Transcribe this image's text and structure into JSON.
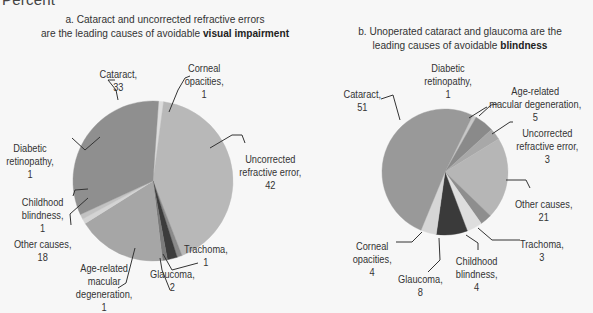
{
  "header": {
    "percent_label": "Percent"
  },
  "chart_data": [
    {
      "type": "pie",
      "id": "a",
      "title_prefix": "a. Cataract and uncorrected refractive errors",
      "title_line2": "are the leading causes of avoidable ",
      "title_bold": "visual impairment",
      "center": [
        153,
        181
      ],
      "radius": 80,
      "start_angle_deg": 4,
      "slices": [
        {
          "name": "Corneal opacities",
          "value": 1,
          "color": "#dcdcdc",
          "label_lines": [
            "Corneal",
            "opacities,",
            "1"
          ]
        },
        {
          "name": "Uncorrected refractive error",
          "value": 42,
          "color": "#b8b8b8",
          "label_lines": [
            "Uncorrected",
            "refractive error,",
            "42"
          ]
        },
        {
          "name": "Trachoma",
          "value": 1,
          "color": "#8a8a8a",
          "label_lines": [
            "Trachoma,",
            "1"
          ]
        },
        {
          "name": "Glaucoma",
          "value": 2,
          "color": "#3c3c3c",
          "label_lines": [
            "Glaucoma,",
            "2"
          ]
        },
        {
          "name": "Age-related macular degeneration",
          "value": 1,
          "color": "#7a7a7a",
          "label_lines": [
            "Age-related",
            "macular",
            "degeneration,",
            "1"
          ]
        },
        {
          "name": "Other causes",
          "value": 18,
          "color": "#a6a6a6",
          "label_lines": [
            "Other causes,",
            "18"
          ]
        },
        {
          "name": "Childhood blindness",
          "value": 1,
          "color": "#d4d4d4",
          "label_lines": [
            "Childhood",
            "blindness,",
            "1"
          ]
        },
        {
          "name": "Diabetic retinopathy",
          "value": 1,
          "color": "#c2c2c2",
          "label_lines": [
            "Diabetic",
            "retinopathy,",
            "1"
          ]
        },
        {
          "name": "Cataract",
          "value": 33,
          "color": "#8f8f8f",
          "label_lines": [
            "Cataract,",
            "33"
          ]
        }
      ]
    },
    {
      "type": "pie",
      "id": "b",
      "title_prefix": "b. Unoperated cataract and glaucoma are the",
      "title_line2": "leading causes of avoidable ",
      "title_bold": "blindness",
      "center": [
        445,
        172
      ],
      "radius": 63,
      "start_angle_deg": 26,
      "slices": [
        {
          "name": "Diabetic retinopathy",
          "value": 1,
          "color": "#c8c8c8",
          "label_lines": [
            "Diabetic",
            "retinopathy,",
            "1"
          ]
        },
        {
          "name": "Age-related macular degeneration",
          "value": 5,
          "color": "#8a8a8a",
          "label_lines": [
            "Age-related",
            "macular degeneration,",
            "5"
          ]
        },
        {
          "name": "Uncorrected refractive error",
          "value": 3,
          "color": "#a8a8a8",
          "label_lines": [
            "Uncorrected",
            "refractive error,",
            "3"
          ]
        },
        {
          "name": "Other causes",
          "value": 21,
          "color": "#b6b6b6",
          "label_lines": [
            "Other causes,",
            "21"
          ]
        },
        {
          "name": "Trachoma",
          "value": 3,
          "color": "#8e8e8e",
          "label_lines": [
            "Trachoma,",
            "3"
          ]
        },
        {
          "name": "Childhood blindness",
          "value": 4,
          "color": "#dedede",
          "label_lines": [
            "Childhood",
            "blindness,",
            "4"
          ]
        },
        {
          "name": "Glaucoma",
          "value": 8,
          "color": "#3a3a3a",
          "label_lines": [
            "Glaucoma,",
            "8"
          ]
        },
        {
          "name": "Corneal opacities",
          "value": 4,
          "color": "#d6d6d6",
          "label_lines": [
            "Corneal",
            "opacities,",
            "4"
          ]
        },
        {
          "name": "Cataract",
          "value": 51,
          "color": "#999999",
          "label_lines": [
            "Cataract,",
            "51"
          ]
        }
      ]
    }
  ],
  "labels": [
    {
      "chart": 0,
      "slice": 8,
      "x": 118,
      "y": 68
    },
    {
      "chart": 0,
      "slice": 0,
      "x": 204,
      "y": 62
    },
    {
      "chart": 0,
      "slice": 1,
      "x": 270,
      "y": 153
    },
    {
      "chart": 0,
      "slice": 7,
      "x": 30,
      "y": 142
    },
    {
      "chart": 0,
      "slice": 6,
      "x": 42,
      "y": 196
    },
    {
      "chart": 0,
      "slice": 5,
      "x": 42,
      "y": 238
    },
    {
      "chart": 0,
      "slice": 4,
      "x": 104,
      "y": 262
    },
    {
      "chart": 0,
      "slice": 3,
      "x": 172,
      "y": 268
    },
    {
      "chart": 0,
      "slice": 2,
      "x": 206,
      "y": 243
    },
    {
      "chart": 1,
      "slice": 8,
      "x": 362,
      "y": 88
    },
    {
      "chart": 1,
      "slice": 0,
      "x": 448,
      "y": 62
    },
    {
      "chart": 1,
      "slice": 1,
      "x": 535,
      "y": 85
    },
    {
      "chart": 1,
      "slice": 2,
      "x": 547,
      "y": 127
    },
    {
      "chart": 1,
      "slice": 3,
      "x": 543,
      "y": 198
    },
    {
      "chart": 1,
      "slice": 4,
      "x": 542,
      "y": 238
    },
    {
      "chart": 1,
      "slice": 5,
      "x": 476,
      "y": 255
    },
    {
      "chart": 1,
      "slice": 6,
      "x": 420,
      "y": 273
    },
    {
      "chart": 1,
      "slice": 7,
      "x": 372,
      "y": 240
    }
  ],
  "leaders": [
    [
      [
        118,
        100
      ],
      [
        116,
        90
      ],
      [
        108,
        80
      ],
      [
        115,
        80
      ]
    ],
    [
      [
        169,
        112
      ],
      [
        178,
        90
      ],
      [
        185,
        78
      ],
      [
        190,
        76
      ]
    ],
    [
      [
        210,
        148
      ],
      [
        232,
        135
      ],
      [
        242,
        135
      ],
      [
        245,
        143
      ]
    ],
    [
      [
        100,
        137
      ],
      [
        85,
        150
      ],
      [
        72,
        138
      ]
    ],
    [
      [
        88,
        189
      ],
      [
        75,
        190
      ],
      [
        73,
        196
      ]
    ],
    [
      [
        88,
        198
      ],
      [
        70,
        214
      ],
      [
        71,
        225
      ]
    ],
    [
      [
        135,
        248
      ],
      [
        126,
        283
      ],
      [
        118,
        288
      ]
    ],
    [
      [
        160,
        258
      ],
      [
        162,
        270
      ],
      [
        170,
        290
      ]
    ],
    [
      [
        163,
        254
      ],
      [
        172,
        270
      ],
      [
        198,
        263
      ]
    ],
    [
      [
        400,
        120
      ],
      [
        393,
        95
      ],
      [
        381,
        99
      ]
    ],
    [
      [
        469,
        118
      ],
      [
        485,
        108
      ],
      [
        487,
        107
      ]
    ],
    [
      [
        479,
        116
      ],
      [
        491,
        105
      ],
      [
        498,
        104
      ]
    ],
    [
      [
        492,
        134
      ],
      [
        510,
        122
      ],
      [
        513,
        122
      ]
    ],
    [
      [
        506,
        180
      ],
      [
        526,
        180
      ],
      [
        530,
        188
      ]
    ],
    [
      [
        478,
        228
      ],
      [
        492,
        240
      ],
      [
        520,
        240
      ]
    ],
    [
      [
        466,
        235
      ],
      [
        478,
        243
      ],
      [
        478,
        250
      ]
    ],
    [
      [
        439,
        238
      ],
      [
        440,
        260
      ],
      [
        428,
        272
      ]
    ],
    [
      [
        422,
        232
      ],
      [
        412,
        242
      ],
      [
        396,
        242
      ]
    ]
  ]
}
